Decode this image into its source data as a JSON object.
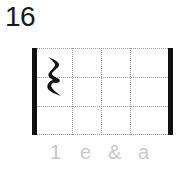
{
  "exercise": {
    "number": "16"
  },
  "rhythm_grid": {
    "rows": 3,
    "columns": 4,
    "rest_symbol": "quarter-rest",
    "rest_position": {
      "row": 0,
      "column": 0,
      "row_span": 2
    },
    "beat_labels": [
      "1",
      "e",
      "&",
      "a"
    ]
  }
}
